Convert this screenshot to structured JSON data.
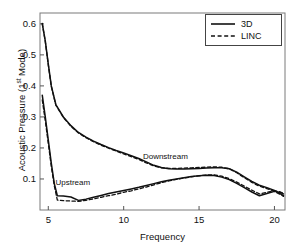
{
  "chart_data": {
    "type": "line",
    "title": "",
    "xlabel": "Frequency",
    "ylabel_parts": {
      "pre": "Acoustic Pressure (1",
      "sup": "st",
      "post": " Mode)"
    },
    "ylabel": "Acoustic Pressure (1st Mode)",
    "xlim": [
      4.45,
      20.7
    ],
    "ylim": [
      0.0,
      0.635
    ],
    "xticks": [
      5,
      10,
      15,
      20
    ],
    "xtick_labels": [
      "5",
      "10",
      "15",
      "20"
    ],
    "yticks": [
      0.1,
      0.2,
      0.3,
      0.4,
      0.5,
      0.6
    ],
    "ytick_labels": [
      "0.1",
      "0.2",
      "0.3",
      "0.4",
      "0.5",
      "0.6"
    ],
    "grid": false,
    "legend_position": "top-right",
    "annotations": [
      {
        "text": "Downstream",
        "x": 13.0,
        "y": 0.168
      },
      {
        "text": "Upstream",
        "x": 7.2,
        "y": 0.083
      }
    ],
    "series": [
      {
        "name": "3D",
        "style": "solid",
        "color": "#111111",
        "branch": "Downstream",
        "x": [
          4.6,
          4.8,
          5.0,
          5.2,
          5.5,
          6.0,
          6.5,
          7.0,
          7.5,
          8.0,
          8.5,
          9.0,
          9.5,
          10.0,
          10.5,
          11.0,
          11.5,
          12.0,
          12.5,
          13.0,
          13.5,
          14.0,
          14.5,
          15.0,
          15.5,
          16.0,
          16.5,
          17.0,
          17.5,
          18.0,
          18.5,
          19.0,
          19.5,
          20.0,
          20.4,
          20.6
        ],
        "y": [
          0.601,
          0.545,
          0.47,
          0.4,
          0.34,
          0.3,
          0.272,
          0.25,
          0.235,
          0.222,
          0.211,
          0.201,
          0.192,
          0.184,
          0.175,
          0.166,
          0.155,
          0.144,
          0.137,
          0.133,
          0.132,
          0.132,
          0.133,
          0.134,
          0.135,
          0.136,
          0.136,
          0.133,
          0.122,
          0.107,
          0.092,
          0.08,
          0.072,
          0.063,
          0.052,
          0.046
        ]
      },
      {
        "name": "LINC",
        "style": "dashed",
        "color": "#111111",
        "branch": "Downstream",
        "x": [
          4.6,
          4.8,
          5.0,
          5.2,
          5.5,
          6.0,
          6.5,
          7.0,
          7.5,
          8.0,
          8.5,
          9.0,
          9.5,
          10.0,
          10.5,
          11.0,
          11.5,
          12.0,
          12.5,
          13.0,
          13.5,
          14.0,
          14.5,
          15.0,
          15.5,
          16.0,
          16.5,
          17.0,
          17.5,
          18.0,
          18.5,
          19.0,
          19.5,
          20.0,
          20.4,
          20.6
        ],
        "y": [
          0.601,
          0.543,
          0.468,
          0.398,
          0.338,
          0.298,
          0.27,
          0.248,
          0.233,
          0.22,
          0.209,
          0.199,
          0.19,
          0.181,
          0.172,
          0.163,
          0.152,
          0.142,
          0.136,
          0.134,
          0.134,
          0.135,
          0.136,
          0.137,
          0.138,
          0.139,
          0.138,
          0.133,
          0.12,
          0.104,
          0.089,
          0.077,
          0.069,
          0.06,
          0.05,
          0.044
        ]
      },
      {
        "name": "3D",
        "style": "solid",
        "color": "#111111",
        "branch": "Upstream",
        "x": [
          4.6,
          4.8,
          5.0,
          5.2,
          5.4,
          5.6,
          6.0,
          6.5,
          7.0,
          7.5,
          8.0,
          8.5,
          9.0,
          9.5,
          10.0,
          10.5,
          11.0,
          11.5,
          12.0,
          12.5,
          13.0,
          13.5,
          14.0,
          14.5,
          15.0,
          15.5,
          16.0,
          16.5,
          17.0,
          17.5,
          18.0,
          18.5,
          19.0,
          19.5,
          20.0,
          20.4,
          20.6
        ],
        "y": [
          0.37,
          0.3,
          0.225,
          0.15,
          0.085,
          0.046,
          0.045,
          0.042,
          0.031,
          0.035,
          0.041,
          0.047,
          0.053,
          0.058,
          0.063,
          0.068,
          0.073,
          0.079,
          0.085,
          0.091,
          0.096,
          0.1,
          0.104,
          0.108,
          0.11,
          0.112,
          0.111,
          0.106,
          0.098,
          0.086,
          0.072,
          0.058,
          0.046,
          0.053,
          0.06,
          0.056,
          0.052
        ]
      },
      {
        "name": "LINC",
        "style": "dashed",
        "color": "#111111",
        "branch": "Upstream",
        "x": [
          4.6,
          4.8,
          5.0,
          5.2,
          5.4,
          5.6,
          6.0,
          6.5,
          7.0,
          7.5,
          8.0,
          8.5,
          9.0,
          9.5,
          10.0,
          10.5,
          11.0,
          11.5,
          12.0,
          12.5,
          13.0,
          13.5,
          14.0,
          14.5,
          15.0,
          15.5,
          16.0,
          16.5,
          17.0,
          17.5,
          18.0,
          18.5,
          19.0,
          19.5,
          20.0,
          20.4,
          20.6
        ],
        "y": [
          0.355,
          0.288,
          0.215,
          0.14,
          0.078,
          0.032,
          0.03,
          0.029,
          0.028,
          0.031,
          0.036,
          0.041,
          0.046,
          0.051,
          0.057,
          0.062,
          0.068,
          0.074,
          0.081,
          0.088,
          0.094,
          0.099,
          0.103,
          0.107,
          0.11,
          0.113,
          0.113,
          0.109,
          0.101,
          0.09,
          0.077,
          0.064,
          0.052,
          0.057,
          0.062,
          0.058,
          0.054
        ]
      }
    ],
    "legend": [
      {
        "label": "3D",
        "style": "solid"
      },
      {
        "label": "LINC",
        "style": "dashed"
      }
    ]
  }
}
